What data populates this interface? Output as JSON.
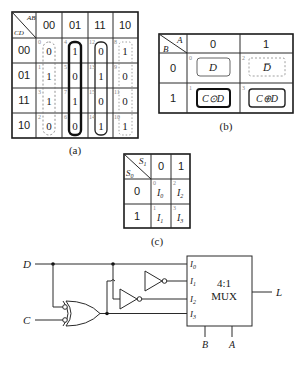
{
  "kmap_a": {
    "corner_top": "AB",
    "corner_bottom": "CD",
    "col_headers": [
      "00",
      "01",
      "11",
      "10"
    ],
    "row_headers": [
      "00",
      "01",
      "11",
      "10"
    ],
    "cells": [
      [
        {
          "idx": "0",
          "val": "0"
        },
        {
          "idx": "4",
          "val": "1"
        },
        {
          "idx": "12",
          "val": "0"
        },
        {
          "idx": "8",
          "val": "1"
        }
      ],
      [
        {
          "idx": "1",
          "val": "1"
        },
        {
          "idx": "5",
          "val": "0"
        },
        {
          "idx": "13",
          "val": "1"
        },
        {
          "idx": "9",
          "val": "0"
        }
      ],
      [
        {
          "idx": "3",
          "val": "1"
        },
        {
          "idx": "7",
          "val": "1"
        },
        {
          "idx": "15",
          "val": "0"
        },
        {
          "idx": "11",
          "val": "0"
        }
      ],
      [
        {
          "idx": "2",
          "val": "0"
        },
        {
          "idx": "6",
          "val": "0"
        },
        {
          "idx": "14",
          "val": "1"
        },
        {
          "idx": "10",
          "val": "1"
        }
      ]
    ],
    "caption": "(a)"
  },
  "kmap_b": {
    "corner_top": "A",
    "corner_bottom": "B",
    "col_headers": [
      "0",
      "1"
    ],
    "row_headers": [
      "0",
      "1"
    ],
    "cells": [
      [
        {
          "idx": "0",
          "val": "D"
        },
        {
          "idx": "2",
          "val": "D̅"
        }
      ],
      [
        {
          "idx": "1",
          "val": "C⊙D"
        },
        {
          "idx": "3",
          "val": "C⊕D"
        }
      ]
    ],
    "caption": "(b)"
  },
  "kmap_c": {
    "corner_top": "S1",
    "corner_bottom": "S0",
    "col_headers": [
      "0",
      "1"
    ],
    "row_headers": [
      "0",
      "1"
    ],
    "cells": [
      [
        {
          "idx": "0",
          "val": "I0"
        },
        {
          "idx": "2",
          "val": "I2"
        }
      ],
      [
        {
          "idx": "1",
          "val": "I1"
        },
        {
          "idx": "3",
          "val": "I3"
        }
      ]
    ],
    "caption": "(c)"
  },
  "circuit": {
    "inputs": {
      "d": "D",
      "c": "C"
    },
    "mux": {
      "title_line1": "4:1",
      "title_line2": "MUX",
      "input_labels": [
        "I0",
        "I1",
        "I2",
        "I3"
      ],
      "select_labels": [
        "B",
        "A"
      ],
      "output_label": "L"
    },
    "gates": [
      "XNOR (C, D)",
      "NOT (XNOR)",
      "NOT (D)"
    ]
  }
}
